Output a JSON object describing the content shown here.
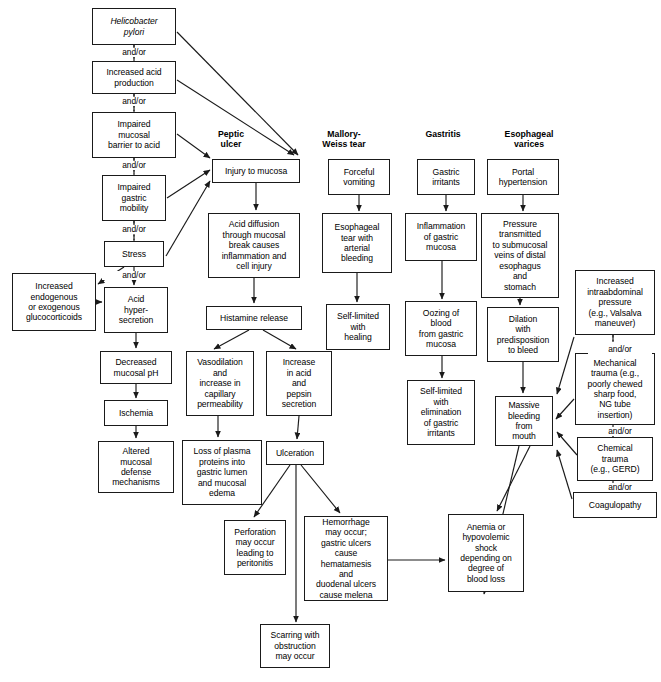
{
  "diagram": {
    "title_headers": [
      {
        "id": "hdr-peptic-ulcer",
        "label": "Peptic\nulcer",
        "x": 196,
        "y": 129,
        "w": 70
      },
      {
        "id": "hdr-mallory-weiss",
        "label": "Mallory-\nWeiss tear",
        "x": 303,
        "y": 129,
        "w": 82
      },
      {
        "id": "hdr-gastritis",
        "label": "Gastritis",
        "x": 404,
        "y": 129,
        "w": 78
      },
      {
        "id": "hdr-esophageal-varices",
        "label": "Esophageal\nvarices",
        "x": 480,
        "y": 129,
        "w": 98
      }
    ],
    "connector_labels": [
      {
        "id": "andor-1",
        "label": "and/or",
        "x": 102,
        "y": 48
      },
      {
        "id": "andor-2",
        "label": "and/or",
        "x": 102,
        "y": 97
      },
      {
        "id": "andor-3",
        "label": "and/or",
        "x": 102,
        "y": 161
      },
      {
        "id": "andor-4",
        "label": "and/or",
        "x": 102,
        "y": 225
      },
      {
        "id": "andor-5",
        "label": "and/or",
        "x": 102,
        "y": 271
      },
      {
        "id": "andor-6",
        "label": "and/or",
        "x": 588,
        "y": 345
      },
      {
        "id": "andor-7",
        "label": "and/or",
        "x": 588,
        "y": 427
      },
      {
        "id": "andor-8",
        "label": "and/or",
        "x": 588,
        "y": 483
      }
    ],
    "nodes": [
      {
        "id": "helicobacter-pylori",
        "label": "Helicobacter\npylori",
        "x": 92,
        "y": 8,
        "w": 84,
        "h": 37,
        "italic": true
      },
      {
        "id": "increased-acid-production",
        "label": "Increased acid\nproduction",
        "x": 92,
        "y": 61,
        "w": 84,
        "h": 33
      },
      {
        "id": "impaired-mucosal-barrier",
        "label": "Impaired\nmucosal\nbarrier to acid",
        "x": 92,
        "y": 112,
        "w": 84,
        "h": 46
      },
      {
        "id": "impaired-gastric-mobility",
        "label": "Impaired\ngastric\nmobility",
        "x": 102,
        "y": 175,
        "w": 64,
        "h": 46
      },
      {
        "id": "stress",
        "label": "Stress",
        "x": 104,
        "y": 241,
        "w": 60,
        "h": 26
      },
      {
        "id": "increased-glucocorticoids",
        "label": "Increased\nendogenous\nor exogenous\nglucocorticoids",
        "x": 12,
        "y": 273,
        "w": 84,
        "h": 58
      },
      {
        "id": "acid-hypersecretion",
        "label": "Acid\nhyper-\nsecretion",
        "x": 104,
        "y": 287,
        "w": 64,
        "h": 46
      },
      {
        "id": "decreased-mucosal-ph",
        "label": "Decreased\nmucosal pH",
        "x": 100,
        "y": 351,
        "w": 72,
        "h": 33
      },
      {
        "id": "ischemia",
        "label": "Ischemia",
        "x": 104,
        "y": 400,
        "w": 64,
        "h": 26
      },
      {
        "id": "altered-mucosal-defense",
        "label": "Altered\nmucosal\ndefense\nmechanisms",
        "x": 98,
        "y": 441,
        "w": 76,
        "h": 52
      },
      {
        "id": "injury-to-mucosa",
        "label": "Injury to mucosa",
        "x": 212,
        "y": 159,
        "w": 88,
        "h": 24
      },
      {
        "id": "acid-diffusion",
        "label": "Acid diffusion\nthrough mucosal\nbreak causes\ninflammation and\ncell injury",
        "x": 208,
        "y": 213,
        "w": 92,
        "h": 65
      },
      {
        "id": "histamine-release",
        "label": "Histamine release",
        "x": 206,
        "y": 306,
        "w": 96,
        "h": 24
      },
      {
        "id": "vasodilation",
        "label": "Vasodilation\nand\nincrease in\ncapillary\npermeability",
        "x": 186,
        "y": 351,
        "w": 68,
        "h": 65
      },
      {
        "id": "increase-acid-pepsin",
        "label": "Increase\nin acid\nand\npepsin\nsecretion",
        "x": 266,
        "y": 351,
        "w": 66,
        "h": 65
      },
      {
        "id": "loss-of-plasma-proteins",
        "label": "Loss of plasma\nproteins into\ngastric lumen\nand mucosal\nedema",
        "x": 182,
        "y": 440,
        "w": 80,
        "h": 65
      },
      {
        "id": "ulceration",
        "label": "Ulceration",
        "x": 266,
        "y": 441,
        "w": 58,
        "h": 24
      },
      {
        "id": "perforation",
        "label": "Perforation\nmay occur\nleading to\nperitonitis",
        "x": 224,
        "y": 520,
        "w": 62,
        "h": 55
      },
      {
        "id": "hemorrhage",
        "label": "Hemorrhage\nmay occur;\ngastric ulcers\ncause\nhematamesis\nand\nduodenal ulcers\ncause melena",
        "x": 304,
        "y": 516,
        "w": 84,
        "h": 85
      },
      {
        "id": "scarring-obstruction",
        "label": "Scarring with\nobstruction\nmay occur",
        "x": 260,
        "y": 624,
        "w": 70,
        "h": 44
      },
      {
        "id": "forceful-vomiting",
        "label": "Forceful\nvomiting",
        "x": 328,
        "y": 159,
        "w": 62,
        "h": 36
      },
      {
        "id": "esophageal-tear",
        "label": "Esophageal\ntear with\narterial\nbleeding",
        "x": 322,
        "y": 213,
        "w": 70,
        "h": 60
      },
      {
        "id": "self-limited-healing",
        "label": "Self-limited\nwith\nhealing",
        "x": 326,
        "y": 304,
        "w": 64,
        "h": 46
      },
      {
        "id": "gastric-irritants",
        "label": "Gastric\nirritants",
        "x": 417,
        "y": 159,
        "w": 58,
        "h": 36
      },
      {
        "id": "inflammation-gastric-mucosa",
        "label": "Inflammation\nof gastric\nmucosa",
        "x": 405,
        "y": 213,
        "w": 72,
        "h": 48
      },
      {
        "id": "oozing-of-blood",
        "label": "Oozing of\nblood\nfrom gastric\nmucosa",
        "x": 405,
        "y": 301,
        "w": 72,
        "h": 55
      },
      {
        "id": "self-limited-elimination",
        "label": "Self-limited\nwith\nelimination\nof gastric\nirritants",
        "x": 407,
        "y": 380,
        "w": 68,
        "h": 65
      },
      {
        "id": "portal-hypertension",
        "label": "Portal\nhypertension",
        "x": 487,
        "y": 159,
        "w": 72,
        "h": 36
      },
      {
        "id": "pressure-transmitted",
        "label": "Pressure\ntransmitted\nto submucosal\nveins of distal\nesophagus\nand\nstomach",
        "x": 481,
        "y": 213,
        "w": 78,
        "h": 85
      },
      {
        "id": "dilation-predisposition",
        "label": "Dilation\nwith\npredisposition\nto bleed",
        "x": 487,
        "y": 307,
        "w": 72,
        "h": 55
      },
      {
        "id": "massive-bleeding",
        "label": "Massive\nbleeding\nfrom\nmouth",
        "x": 495,
        "y": 396,
        "w": 58,
        "h": 50
      },
      {
        "id": "increased-intraabdominal-pressure",
        "label": "Increased\nintraabdominal\npressure\n(e.g., Valsalva\nmaneuver)",
        "x": 575,
        "y": 270,
        "w": 80,
        "h": 65
      },
      {
        "id": "mechanical-trauma",
        "label": "Mechanical\ntrauma (e.g.,\npoorly chewed\nsharp food,\nNG tube\ninsertion)",
        "x": 575,
        "y": 353,
        "w": 80,
        "h": 72
      },
      {
        "id": "chemical-trauma",
        "label": "Chemical\ntrauma\n(e.g., GERD)",
        "x": 577,
        "y": 437,
        "w": 76,
        "h": 44
      },
      {
        "id": "coagulopathy",
        "label": "Coagulopathy",
        "x": 573,
        "y": 492,
        "w": 84,
        "h": 26
      },
      {
        "id": "anemia-hypovolemic-shock",
        "label": "Anemia or\nhypovolemic\nshock\ndepending on\ndegree of\nblood loss",
        "x": 448,
        "y": 514,
        "w": 76,
        "h": 78
      }
    ],
    "edges": [
      {
        "from": "helicobacter-pylori",
        "to": "injury-to-mucosa",
        "type": "arrow"
      },
      {
        "from": "helicobacter-pylori",
        "to": "increased-acid-production",
        "type": "dashed-link"
      },
      {
        "from": "increased-acid-production",
        "to": "injury-to-mucosa",
        "type": "arrow"
      },
      {
        "from": "increased-acid-production",
        "to": "impaired-mucosal-barrier",
        "type": "dashed-link"
      },
      {
        "from": "impaired-mucosal-barrier",
        "to": "injury-to-mucosa",
        "type": "arrow"
      },
      {
        "from": "impaired-mucosal-barrier",
        "to": "impaired-gastric-mobility",
        "type": "dashed-link"
      },
      {
        "from": "impaired-gastric-mobility",
        "to": "injury-to-mucosa",
        "type": "arrow"
      },
      {
        "from": "impaired-gastric-mobility",
        "to": "stress",
        "type": "dashed-link"
      },
      {
        "from": "stress",
        "to": "injury-to-mucosa",
        "type": "arrow"
      },
      {
        "from": "stress",
        "to": "increased-glucocorticoids",
        "type": "arrow"
      },
      {
        "from": "stress",
        "to": "acid-hypersecretion",
        "type": "arrow"
      },
      {
        "from": "increased-glucocorticoids",
        "to": "acid-hypersecretion",
        "type": "arrow"
      },
      {
        "from": "acid-hypersecretion",
        "to": "decreased-mucosal-ph",
        "type": "arrow"
      },
      {
        "from": "decreased-mucosal-ph",
        "to": "ischemia",
        "type": "arrow"
      },
      {
        "from": "ischemia",
        "to": "altered-mucosal-defense",
        "type": "arrow"
      },
      {
        "from": "injury-to-mucosa",
        "to": "acid-diffusion",
        "type": "arrow"
      },
      {
        "from": "acid-diffusion",
        "to": "histamine-release",
        "type": "arrow"
      },
      {
        "from": "histamine-release",
        "to": "vasodilation",
        "type": "arrow"
      },
      {
        "from": "histamine-release",
        "to": "increase-acid-pepsin",
        "type": "arrow"
      },
      {
        "from": "vasodilation",
        "to": "loss-of-plasma-proteins",
        "type": "arrow"
      },
      {
        "from": "increase-acid-pepsin",
        "to": "ulceration",
        "type": "arrow"
      },
      {
        "from": "ulceration",
        "to": "perforation",
        "type": "arrow"
      },
      {
        "from": "ulceration",
        "to": "hemorrhage",
        "type": "arrow"
      },
      {
        "from": "ulceration",
        "to": "scarring-obstruction",
        "type": "arrow"
      },
      {
        "from": "hemorrhage",
        "to": "anemia-hypovolemic-shock",
        "type": "arrow"
      },
      {
        "from": "forceful-vomiting",
        "to": "esophageal-tear",
        "type": "arrow"
      },
      {
        "from": "esophageal-tear",
        "to": "self-limited-healing",
        "type": "arrow"
      },
      {
        "from": "gastric-irritants",
        "to": "inflammation-gastric-mucosa",
        "type": "arrow"
      },
      {
        "from": "inflammation-gastric-mucosa",
        "to": "oozing-of-blood",
        "type": "arrow"
      },
      {
        "from": "oozing-of-blood",
        "to": "self-limited-elimination",
        "type": "arrow"
      },
      {
        "from": "portal-hypertension",
        "to": "pressure-transmitted",
        "type": "arrow"
      },
      {
        "from": "pressure-transmitted",
        "to": "dilation-predisposition",
        "type": "arrow"
      },
      {
        "from": "dilation-predisposition",
        "to": "massive-bleeding",
        "type": "arrow"
      },
      {
        "from": "increased-intraabdominal-pressure",
        "to": "massive-bleeding",
        "type": "arrow"
      },
      {
        "from": "mechanical-trauma",
        "to": "massive-bleeding",
        "type": "arrow"
      },
      {
        "from": "chemical-trauma",
        "to": "massive-bleeding",
        "type": "arrow"
      },
      {
        "from": "coagulopathy",
        "to": "massive-bleeding",
        "type": "arrow"
      },
      {
        "from": "massive-bleeding",
        "to": "anemia-hypovolemic-shock",
        "type": "arrow"
      },
      {
        "from": "increased-intraabdominal-pressure",
        "to": "mechanical-trauma",
        "type": "dashed-link"
      },
      {
        "from": "mechanical-trauma",
        "to": "chemical-trauma",
        "type": "dashed-link"
      },
      {
        "from": "chemical-trauma",
        "to": "coagulopathy",
        "type": "dashed-link"
      }
    ],
    "edge_paths": [
      "M 178,24 L 296,157",
      "M 134,45 L 134,47",
      "M 134,56 L 134,60",
      "M 178,76 L 292,156",
      "M 134,94 L 134,96",
      "M 134,105 L 134,111",
      "M 178,128 L 208,160",
      "M 134,158 L 134,160",
      "M 134,169 L 134,174",
      "M 168,196 L 208,172",
      "M 134,221 L 134,224",
      "M 134,234 L 134,240",
      "M 166,254 L 209,182",
      "M 122,267 L 96,285",
      "M 134,267 L 134,285",
      "M 96,302 L 102,302",
      "M 136,333 L 136,349",
      "M 136,384 L 136,398",
      "M 136,426 L 136,439",
      "M 256,183 L 256,211",
      "M 254,278 L 254,304",
      "M 250,330 L 212,349",
      "M 262,330 L 296,349",
      "M 218,416 L 218,438",
      "M 298,416 L 296,439",
      "M 290,465 L 252,518",
      "M 300,465 L 342,514",
      "M 296,465 L 296,622",
      "M 388,560 L 446,560",
      "M 359,195 L 359,211",
      "M 357,273 L 357,302",
      "M 446,195 L 446,211",
      "M 442,261 L 442,299",
      "M 442,356 L 442,378",
      "M 523,195 L 523,211",
      "M 520,298 L 520,305",
      "M 523,362 L 523,394",
      "M 573,337 L 556,396",
      "M 575,398 L 555,420",
      "M 577,456 L 556,432",
      "M 573,500 L 556,450",
      "M 519,446 L 484,592",
      "M 613,335 L 613,340",
      "M 613,352 L 613,352",
      "M 613,425 L 613,425",
      "M 613,434 L 613,436",
      "M 613,481 L 613,481",
      "M 613,489 L 613,491",
      "M 530,446 L 495,512"
    ]
  }
}
